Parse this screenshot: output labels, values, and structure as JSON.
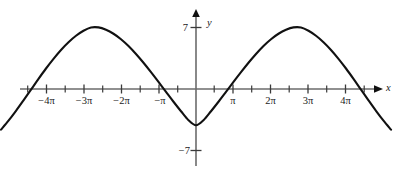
{
  "chart_data": {
    "type": "line",
    "title": "",
    "xlabel": "x",
    "ylabel": "y",
    "function": "y = -7cos(x/2)",
    "amplitude": 7,
    "period": "4π",
    "xlim": [
      -5.2,
      5.2
    ],
    "ylim": [
      -9.2,
      9.2
    ],
    "x_unit": "π",
    "grid": false,
    "legend": null,
    "axis_arrows": [
      "x-positive",
      "y-positive"
    ],
    "x_tick_labels": [
      {
        "value": -4,
        "text": "−4π"
      },
      {
        "value": -3,
        "text": "−3π"
      },
      {
        "value": -2,
        "text": "−2π"
      },
      {
        "value": -1,
        "text": "−π"
      },
      {
        "value": 1,
        "text": "π"
      },
      {
        "value": 2,
        "text": "2π"
      },
      {
        "value": 3,
        "text": "3π"
      },
      {
        "value": 4,
        "text": "4π"
      }
    ],
    "x_minor_ticks": [
      -4.5,
      -3.5,
      -2.5,
      -1.5,
      -0.5,
      0.5,
      1.5,
      2.5,
      3.5,
      4.5
    ],
    "y_tick_labels": [
      {
        "value": 7,
        "text": "7"
      },
      {
        "value": -7,
        "text": "−7"
      }
    ],
    "key_points": [
      {
        "x": -4.5,
        "y": 0,
        "kind": "zero-crossing"
      },
      {
        "x": -3,
        "y": 7,
        "kind": "maximum"
      },
      {
        "x": -1.5,
        "y": 0,
        "kind": "zero-crossing"
      },
      {
        "x": 0,
        "y": -7,
        "kind": "minimum"
      },
      {
        "x": 1.5,
        "y": 0,
        "kind": "zero-crossing"
      },
      {
        "x": 3,
        "y": 7,
        "kind": "maximum"
      },
      {
        "x": 4.5,
        "y": 0,
        "kind": "zero-crossing"
      }
    ],
    "series": [
      {
        "name": "y = -7cos(x/2)",
        "x": [
          -5.2,
          -5.0,
          -4.8,
          -4.6,
          -4.4,
          -4.2,
          -4.0,
          -3.8,
          -3.6,
          -3.4,
          -3.2,
          -3.0,
          -2.8,
          -2.6,
          -2.4,
          -2.2,
          -2.0,
          -1.8,
          -1.6,
          -1.4,
          -1.2,
          -1.0,
          -0.8,
          -0.6,
          -0.4,
          -0.2,
          0.0,
          0.2,
          0.4,
          0.6,
          0.8,
          1.0,
          1.2,
          1.4,
          1.6,
          1.8,
          2.0,
          2.2,
          2.4,
          2.6,
          2.8,
          3.0,
          3.2,
          3.4,
          3.6,
          3.8,
          4.0,
          4.2,
          4.4,
          4.6,
          4.8,
          5.0,
          5.2
        ],
        "y": [
          -4.62,
          -3.6,
          -2.48,
          -1.29,
          -0.07,
          1.15,
          2.33,
          3.43,
          4.44,
          5.32,
          6.05,
          6.62,
          6.99,
          7.0,
          6.73,
          6.28,
          5.66,
          4.89,
          3.98,
          2.98,
          1.91,
          0.8,
          -0.33,
          -1.45,
          -2.53,
          -3.55,
          -4.12,
          -3.55,
          -2.53,
          -1.45,
          -0.33,
          0.8,
          1.91,
          2.98,
          3.98,
          4.89,
          5.66,
          6.28,
          6.73,
          7.0,
          6.99,
          6.62,
          6.05,
          5.32,
          4.44,
          3.43,
          2.33,
          1.15,
          -0.07,
          -1.29,
          -2.48,
          -3.6,
          -4.62
        ]
      }
    ]
  },
  "axis": {
    "x_axis_label": "x",
    "y_axis_label": "y",
    "y_max_label": "7",
    "y_min_label": "−7"
  },
  "colors": {
    "curve": "#111111",
    "axis": "#6b6b6b",
    "text": "#1a1a1a",
    "background": "#ffffff"
  }
}
